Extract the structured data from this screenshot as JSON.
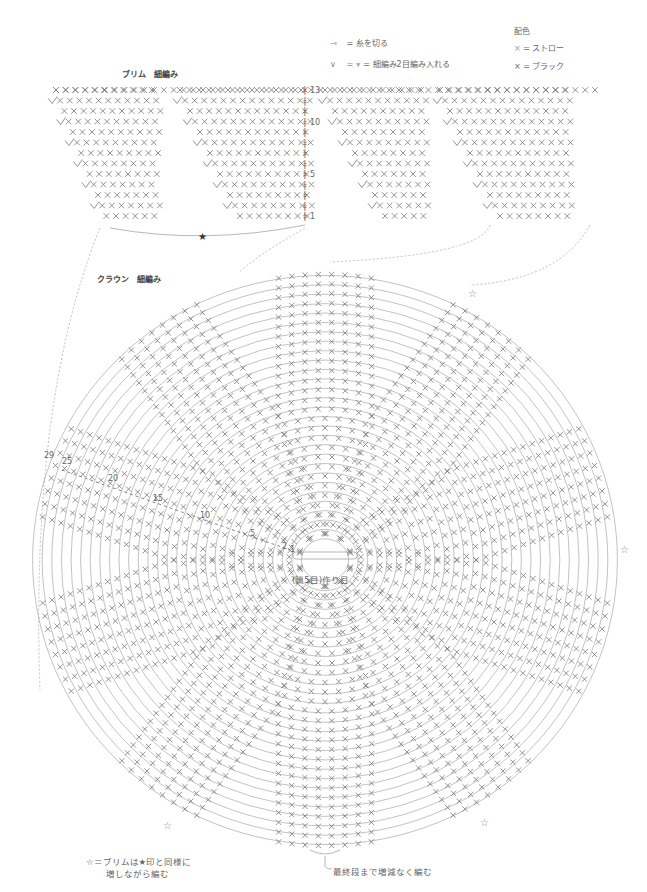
{
  "legend": {
    "cut_yarn": "= 糸を切る",
    "increase": "=  細編み2目編み入れる",
    "color_title": "配色",
    "color_straw": "= ストロー",
    "color_black": "= ブラック"
  },
  "brim": {
    "title": "ブリム　細編み",
    "row_labels": [
      "13",
      "10",
      "5",
      "1"
    ],
    "rows": 13,
    "star_marker": "★"
  },
  "crown": {
    "title": "クラウン　細編み",
    "center_label": "(鎖5目)作り目",
    "round_labels": [
      "29",
      "25",
      "20",
      "15",
      "10",
      "5",
      "2",
      "1"
    ],
    "rounds": 29
  },
  "notes": {
    "star_note_line1": "☆＝ブリムは★印と同様に",
    "star_note_line2": "増しながら編む",
    "bottom_note": "最終段まで増減なく編む"
  },
  "colors": {
    "line": "#9a9a9a",
    "stitch": "#777777",
    "dotted": "#b0b0b0",
    "text": "#555555"
  }
}
